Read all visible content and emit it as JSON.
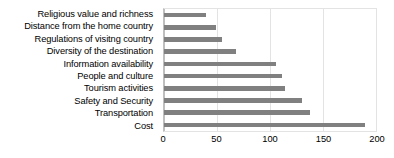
{
  "chart_data": {
    "type": "bar",
    "orientation": "horizontal",
    "title": "",
    "xlabel": "",
    "ylabel": "",
    "xlim": [
      0,
      200
    ],
    "xticks": [
      "0",
      "50",
      "100",
      "150",
      "200"
    ],
    "grid": true,
    "legend": false,
    "bar_color": "#808080",
    "gridline_color": "#e3e3e3",
    "axis_color": "#bfbfbf",
    "categories": [
      "Religious value and richness",
      "Distance from the home country",
      "Regulations of visitng country",
      "Diversity of the destination",
      "Information availability",
      "People and culture",
      "Tourism activities",
      "Safety and Security",
      "Transportation",
      "Cost"
    ],
    "values": [
      40,
      49,
      55,
      68,
      106,
      111,
      114,
      130,
      138,
      190
    ]
  }
}
